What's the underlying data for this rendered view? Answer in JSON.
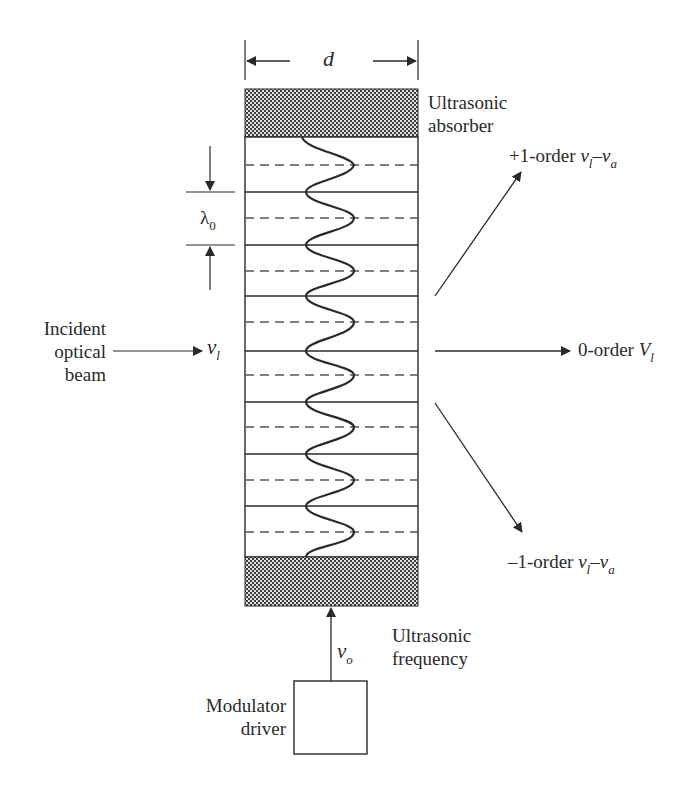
{
  "diagram": {
    "width_label": "d",
    "wavelength_label": {
      "symbol": "λ",
      "subscript": "0"
    },
    "absorber_label": [
      "Ultrasonic",
      "absorber"
    ],
    "incident_label": [
      "Incident",
      "optical",
      "beam"
    ],
    "incident_freq": {
      "symbol": "ν",
      "subscript": "l"
    },
    "plus_order": {
      "prefix": "+1-order ",
      "sym1": "ν",
      "sub1": "l",
      "op": "–",
      "sym2": "ν",
      "sub2": "a"
    },
    "zero_order": {
      "prefix": "0-order ",
      "sym": "V",
      "sub": "l"
    },
    "minus_order": {
      "prefix": "–1-order ",
      "sym1": "ν",
      "sub1": "l",
      "op": "–",
      "sym2": "ν",
      "sub2": "a"
    },
    "drive_freq": {
      "symbol": "ν",
      "subscript": "o"
    },
    "frequency_label": [
      "Ultrasonic",
      "frequency"
    ],
    "driver_label": [
      "Modulator",
      "driver"
    ],
    "colors": {
      "line": "#2a2a2a",
      "hatch_dark": "#3a3a3a",
      "hatch_light": "#e8e8e8",
      "dashed": "#555555"
    }
  }
}
